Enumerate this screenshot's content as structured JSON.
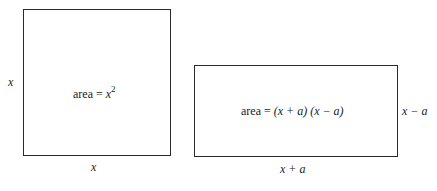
{
  "square": {
    "side_label_left": "x",
    "side_label_bottom": "x",
    "area_prefix": "area = ",
    "area_var": "x",
    "area_exp": "2"
  },
  "rectangle": {
    "side_label_right": "x − a",
    "side_label_bottom": "x + a",
    "area_prefix": "area = ",
    "area_expr": "(x + a) (x − a)"
  }
}
